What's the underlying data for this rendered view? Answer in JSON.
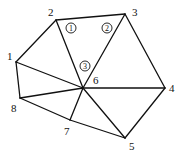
{
  "diagram": {
    "type": "triangular-mesh",
    "nodes": [
      {
        "id": "1",
        "label": "1",
        "x": 16,
        "y": 62,
        "lx": 7,
        "ly": 60
      },
      {
        "id": "2",
        "label": "2",
        "x": 56,
        "y": 20,
        "lx": 48,
        "ly": 16
      },
      {
        "id": "3",
        "label": "3",
        "x": 125,
        "y": 14,
        "lx": 132,
        "ly": 16
      },
      {
        "id": "4",
        "label": "4",
        "x": 165,
        "y": 88,
        "lx": 169,
        "ly": 92
      },
      {
        "id": "5",
        "label": "5",
        "x": 125,
        "y": 138,
        "lx": 129,
        "ly": 150
      },
      {
        "id": "6",
        "label": "6",
        "x": 83,
        "y": 88,
        "lx": 93,
        "ly": 84
      },
      {
        "id": "7",
        "label": "7",
        "x": 70,
        "y": 120,
        "lx": 64,
        "ly": 135
      },
      {
        "id": "8",
        "label": "8",
        "x": 20,
        "y": 98,
        "lx": 11,
        "ly": 112
      }
    ],
    "edges": [
      [
        "1",
        "2"
      ],
      [
        "2",
        "3"
      ],
      [
        "3",
        "4"
      ],
      [
        "4",
        "5"
      ],
      [
        "5",
        "7"
      ],
      [
        "7",
        "8"
      ],
      [
        "8",
        "1"
      ],
      [
        "2",
        "6"
      ],
      [
        "3",
        "6"
      ],
      [
        "1",
        "6"
      ],
      [
        "4",
        "6"
      ],
      [
        "5",
        "6"
      ],
      [
        "7",
        "6"
      ],
      [
        "8",
        "6"
      ]
    ],
    "element_labels": [
      {
        "label": "1",
        "x": 71,
        "y": 28
      },
      {
        "label": "2",
        "x": 107,
        "y": 28
      },
      {
        "label": "3",
        "x": 85,
        "y": 66
      }
    ]
  }
}
